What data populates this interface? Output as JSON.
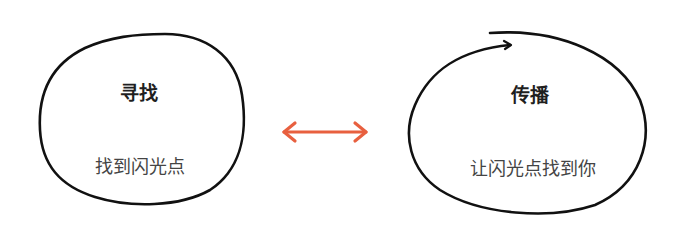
{
  "diagram": {
    "left": {
      "title": "寻找",
      "subtitle": "找到闪光点"
    },
    "right": {
      "title": "传播",
      "subtitle": "让闪光点找到你"
    },
    "connector": {
      "type": "double-headed-arrow",
      "color": "#e8603f"
    },
    "outline_color": "#111111"
  }
}
